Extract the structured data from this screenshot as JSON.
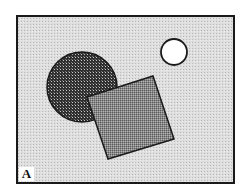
{
  "figure": {
    "panel_label": "A",
    "colors": {
      "background": "#d9d9d9",
      "frame": "#1a1a1a",
      "large_circle_fill": "#4a4a4a",
      "square_fill": "#8f8f8f",
      "small_circle_fill": "#ffffff"
    },
    "shapes": [
      {
        "type": "frame",
        "x": 17,
        "y": 16,
        "width": 217,
        "height": 167
      },
      {
        "type": "large-circle",
        "cx": 82,
        "cy": 87,
        "r": 35,
        "pattern": "crosshatch"
      },
      {
        "type": "rotated-square",
        "points": [
          [
            87,
            97
          ],
          [
            153,
            76
          ],
          [
            174,
            139
          ],
          [
            108,
            159
          ]
        ],
        "pattern": "stipple"
      },
      {
        "type": "small-circle",
        "cx": 174,
        "cy": 52,
        "r": 13,
        "pattern": "none"
      }
    ]
  }
}
